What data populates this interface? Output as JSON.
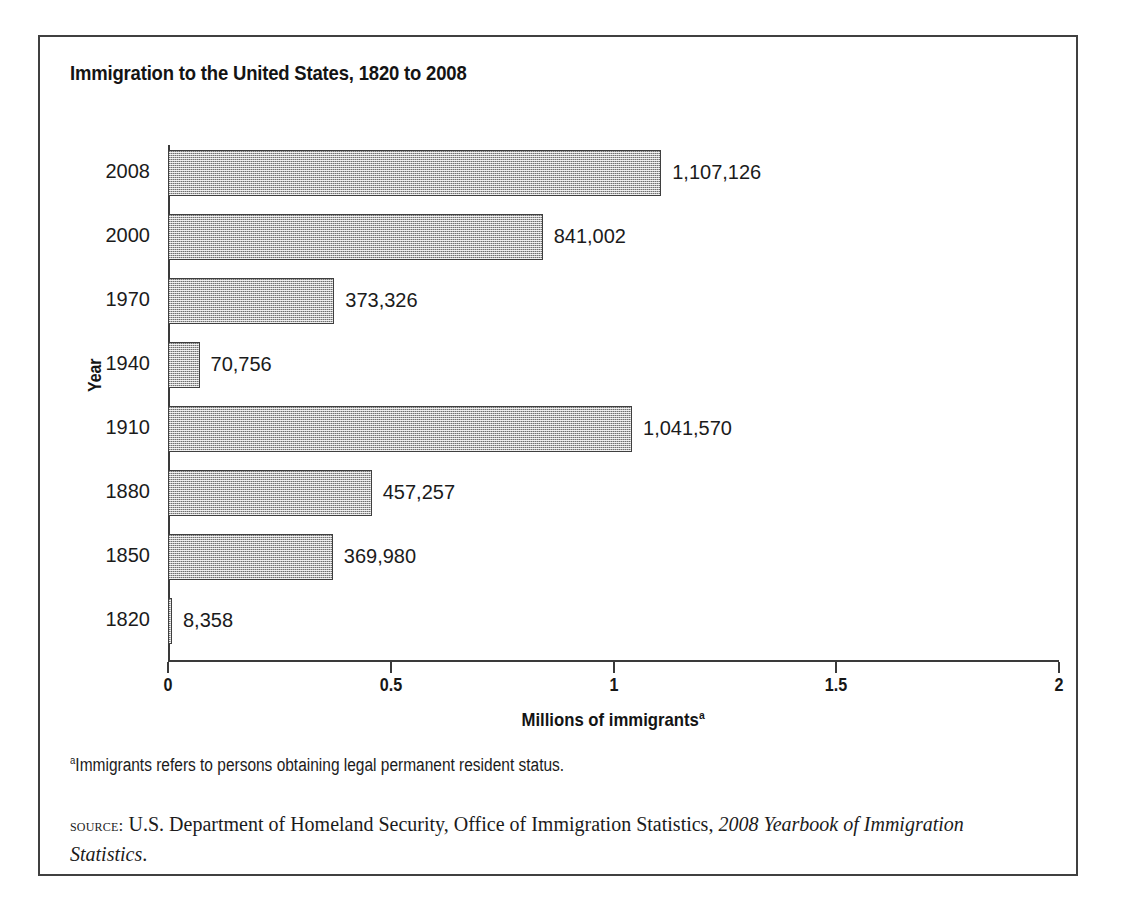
{
  "figure": {
    "title": "Immigration to the United States, 1820 to 2008",
    "footnote_marker": "a",
    "footnote_text": "Immigrants refers to persons obtaining legal permanent resident status.",
    "source_label": "source:",
    "source_roman": " U.S. Department of Homeland Security, Office of Immigration Statistics, ",
    "source_italic": "2008 Yearbook of Immigration Statistics",
    "source_end": "."
  },
  "chart_data": {
    "type": "bar",
    "orientation": "horizontal",
    "title": "Immigration to the United States, 1820 to 2008",
    "xlabel": "Millions of immigrants",
    "xlabel_superscript": "a",
    "ylabel": "Year",
    "xlim": [
      0,
      2
    ],
    "x_unit": "millions",
    "grid": false,
    "legend": false,
    "xticks": [
      "0",
      "0.5",
      "1",
      "1.5",
      "2"
    ],
    "xtick_values": [
      0,
      0.5,
      1,
      1.5,
      2
    ],
    "categories": [
      "2008",
      "2000",
      "1970",
      "1940",
      "1910",
      "1880",
      "1850",
      "1820"
    ],
    "values": [
      1107126,
      841002,
      373326,
      70756,
      1041570,
      457257,
      369980,
      8358
    ],
    "value_labels": [
      "1,107,126",
      "841,002",
      "373,326",
      "70,756",
      "1,041,570",
      "457,257",
      "369,980",
      "8,358"
    ],
    "bar_fill_color": "#b4b4b4",
    "bar_edge_color": "#3f3f3f",
    "bars": [
      {
        "category": "2008",
        "value": 1107126,
        "label": "1,107,126"
      },
      {
        "category": "2000",
        "value": 841002,
        "label": "841,002"
      },
      {
        "category": "1970",
        "value": 373326,
        "label": "373,326"
      },
      {
        "category": "1940",
        "value": 70756,
        "label": "70,756"
      },
      {
        "category": "1910",
        "value": 1041570,
        "label": "1,041,570"
      },
      {
        "category": "1880",
        "value": 457257,
        "label": "457,257"
      },
      {
        "category": "1850",
        "value": 369980,
        "label": "369,980"
      },
      {
        "category": "1820",
        "value": 8358,
        "label": "8,358"
      }
    ]
  }
}
